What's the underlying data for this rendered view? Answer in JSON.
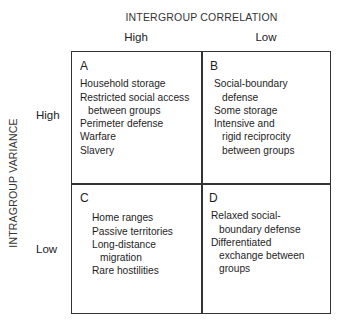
{
  "axes": {
    "top_title": "INTERGROUP CORRELATION",
    "columns": [
      "High",
      "Low"
    ],
    "side_title": "INTRAGROUP VARIANCE",
    "rows": [
      "High",
      "Low"
    ]
  },
  "cells": {
    "a": {
      "letter": "A",
      "lines": [
        {
          "text": "Household storage",
          "indent": false
        },
        {
          "text": "Restricted social access",
          "indent": false
        },
        {
          "text": "between groups",
          "indent": true
        },
        {
          "text": "Perimeter defense",
          "indent": false
        },
        {
          "text": "Warfare",
          "indent": false
        },
        {
          "text": "Slavery",
          "indent": false
        }
      ]
    },
    "b": {
      "letter": "B",
      "lines": [
        {
          "text": "Social-boundary",
          "indent": false
        },
        {
          "text": "defense",
          "indent": true
        },
        {
          "text": "Some storage",
          "indent": false
        },
        {
          "text": "Intensive and",
          "indent": false
        },
        {
          "text": "rigid reciprocity",
          "indent": true
        },
        {
          "text": "between groups",
          "indent": true
        }
      ]
    },
    "c": {
      "letter": "C",
      "lines": [
        {
          "text": "Home ranges",
          "indent": false
        },
        {
          "text": "Passive territories",
          "indent": false
        },
        {
          "text": "Long-distance",
          "indent": false
        },
        {
          "text": "migration",
          "indent": true
        },
        {
          "text": "Rare hostilities",
          "indent": false
        }
      ]
    },
    "d": {
      "letter": "D",
      "lines": [
        {
          "text": "Relaxed social-",
          "indent": false
        },
        {
          "text": "boundary defense",
          "indent": true
        },
        {
          "text": "Differentiated",
          "indent": false
        },
        {
          "text": "exchange between",
          "indent": true
        },
        {
          "text": "groups",
          "indent": true
        }
      ]
    }
  }
}
